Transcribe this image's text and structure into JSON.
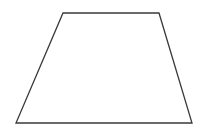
{
  "diagram": {
    "shape": "trapezoid",
    "background": "#ffffff",
    "stroke": "#3a3a3a",
    "stroke_width": 1.3,
    "fill": "#ffffff",
    "vertices": [
      {
        "x": 63,
        "y": 13
      },
      {
        "x": 159,
        "y": 13
      },
      {
        "x": 192,
        "y": 123
      },
      {
        "x": 16,
        "y": 123
      }
    ]
  }
}
